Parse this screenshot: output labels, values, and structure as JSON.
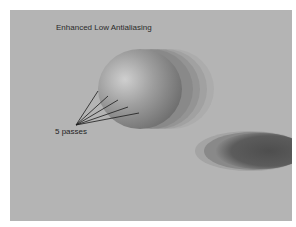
{
  "title": "Enhanced Low Antialiasing",
  "annotation": {
    "label": "5 passes",
    "pass_count": 5
  },
  "colors": {
    "page_background": "#ffffff",
    "canvas_background": "#b4b4b4",
    "sphere_light": "#c8c8c8",
    "sphere_dark": "#6e6e6e",
    "shadow": "#5a5a5a",
    "leader_line": "#1a1a1a"
  }
}
